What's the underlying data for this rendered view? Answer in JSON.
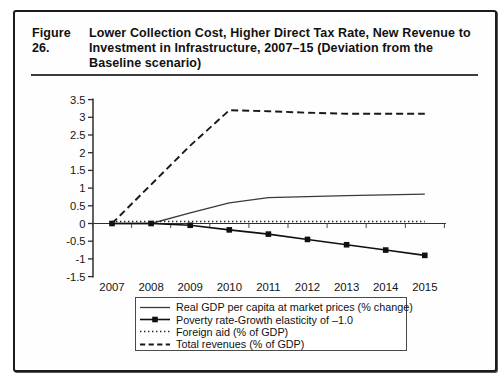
{
  "figure": {
    "label": "Figure 26.",
    "title_lines": [
      "Lower Collection Cost, Higher Direct Tax Rate, New Revenue to",
      "Investment in Infrastructure, 2007–15 (Deviation from the",
      "Baseline scenario)"
    ]
  },
  "chart_data": {
    "type": "line",
    "title": "Figure 26. Lower Collection Cost, Higher Direct Tax Rate, New Revenue to Investment in Infrastructure, 2007–15 (Deviation from the Baseline scenario)",
    "x": [
      2007,
      2008,
      2009,
      2010,
      2011,
      2012,
      2013,
      2014,
      2015
    ],
    "xtick_labels": [
      "2007",
      "2008",
      "2009",
      "2010",
      "2011",
      "2012",
      "2013",
      "2014",
      "2015"
    ],
    "ylim": [
      -1.5,
      3.5
    ],
    "ytick_step": 0.5,
    "ytick_labels": [
      "3.5",
      "3",
      "2.5",
      "2",
      "1.5",
      "1",
      "0.5",
      "0",
      "-0.5",
      "-1",
      "-1.5"
    ],
    "grid": false,
    "legend_position": "bottom",
    "line_color": "#1a1a1a",
    "series": [
      {
        "name": "Real GDP per capita at market prices (% change)",
        "style": "solid",
        "marker": "none",
        "values": [
          0,
          0,
          0.3,
          0.58,
          0.73,
          0.76,
          0.79,
          0.81,
          0.83
        ]
      },
      {
        "name": "Poverty rate-Growth elasticity of –1.0",
        "style": "solid-marker",
        "marker": "square",
        "values": [
          0,
          0,
          -0.05,
          -0.18,
          -0.3,
          -0.45,
          -0.6,
          -0.75,
          -0.9
        ]
      },
      {
        "name": "Foreign aid (% of GDP)",
        "style": "dotted",
        "marker": "none",
        "values": [
          0,
          0,
          0,
          0,
          0,
          0,
          0,
          0,
          0
        ]
      },
      {
        "name": "Total revenues (% of GDP)",
        "style": "dashed",
        "marker": "none",
        "values": [
          0,
          1.1,
          2.2,
          3.2,
          3.17,
          3.13,
          3.1,
          3.1,
          3.1
        ]
      }
    ]
  }
}
